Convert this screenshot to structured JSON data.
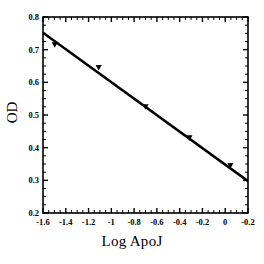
{
  "chart_data": {
    "type": "scatter",
    "title": "",
    "xlabel": "Log ApoJ",
    "ylabel": "OD",
    "xlim": [
      -1.6,
      -0.2
    ],
    "ylim": [
      0.2,
      0.8
    ],
    "xticks": [
      -1.6,
      -1.4,
      -1.2,
      -1,
      -0.8,
      -0.6,
      -0.4,
      -0.2,
      0,
      -0.2
    ],
    "xtick_labels": [
      "-1.6",
      "-1.4",
      "-1.2",
      "-1",
      "-0.8",
      "-0.6",
      "-0.4",
      "-0.2",
      "0",
      "-0.2"
    ],
    "yticks": [
      0.2,
      0.3,
      0.4,
      0.5,
      0.6,
      0.7,
      0.8
    ],
    "ytick_labels": [
      "0.2",
      "0.3",
      "0.4",
      "0.5",
      "0.6",
      "0.7",
      "0.8"
    ],
    "grid": false,
    "legend": "none",
    "marker": "filled-triangle",
    "marker_color": "#000000",
    "line_color": "#000000",
    "reference_line_color": "#808080",
    "reference_line_x": 0,
    "series": [
      {
        "name": "OD vs Log ApoJ",
        "x": [
          -1.52,
          -1.22,
          -0.9,
          -0.6,
          -0.32,
          -0.02
        ],
        "y": [
          0.715,
          0.645,
          0.525,
          0.43,
          0.345,
          0.24
        ]
      }
    ],
    "fit_line": {
      "name": "linear fit",
      "x": [
        -1.6,
        0.1
      ],
      "y": [
        0.752,
        0.2
      ],
      "slope": -0.3247,
      "intercept": 0.2325
    }
  }
}
